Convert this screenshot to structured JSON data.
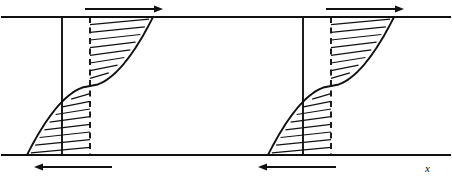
{
  "figure": {
    "width": 452,
    "height": 181,
    "background_color": "#ffffff",
    "line_color": "#111111"
  },
  "axes": {
    "x_label": "x",
    "x_label_position": {
      "x": 425,
      "y": 172
    }
  },
  "geometry": {
    "top_boundary_y": 17,
    "bottom_boundary_y": 155,
    "left_edge_x": 2,
    "right_edge_x": 450,
    "channel_height": 138
  },
  "arrows": [
    {
      "name": "top-flow-arrow-left",
      "direction": "right",
      "x_start": 85,
      "x_end": 163,
      "y": 9,
      "label": ""
    },
    {
      "name": "top-flow-arrow-right",
      "direction": "right",
      "x_start": 326,
      "x_end": 404,
      "y": 9,
      "label": ""
    },
    {
      "name": "bottom-flow-arrow-left",
      "direction": "left",
      "x_start": 34,
      "x_end": 112,
      "y": 167,
      "label": ""
    },
    {
      "name": "bottom-flow-arrow-right",
      "direction": "left",
      "x_start": 258,
      "x_end": 336,
      "y": 167,
      "label": ""
    }
  ],
  "profiles": [
    {
      "name": "velocity-profile-left",
      "wall_x": 62,
      "reference_x": 90,
      "curve_top_x": 161,
      "curve_bottom_x": 35,
      "midpoint_y": 86,
      "hatch_count_upper": 8,
      "hatch_count_lower": 8
    },
    {
      "name": "velocity-profile-right",
      "wall_x": 303,
      "reference_x": 331,
      "curve_top_x": 402,
      "curve_bottom_x": 276,
      "midpoint_y": 86,
      "hatch_count_upper": 8,
      "hatch_count_lower": 8
    }
  ]
}
